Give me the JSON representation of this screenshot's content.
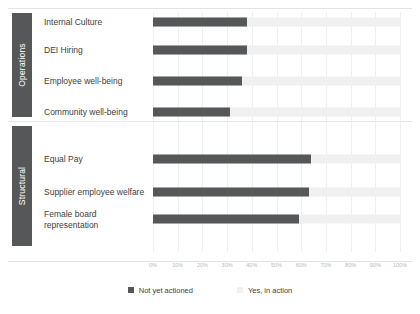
{
  "chart_data": {
    "type": "bar",
    "orientation": "horizontal",
    "stacked": true,
    "title": "",
    "xlabel": "",
    "ylabel": "",
    "xlim": [
      0,
      100
    ],
    "grid": true,
    "legend_position": "bottom",
    "axis_ticks": [
      "0%",
      "10%",
      "20%",
      "30%",
      "40%",
      "50%",
      "60%",
      "70%",
      "80%",
      "90%",
      "100%"
    ],
    "axis_tick_values": [
      0,
      10,
      20,
      30,
      40,
      50,
      60,
      70,
      80,
      90,
      100
    ],
    "legend": [
      {
        "name": "Not yet actioned",
        "color": "#555759"
      },
      {
        "name": "Yes, in action",
        "color": "#f0f0f0"
      }
    ],
    "groups": [
      {
        "name": "Operations",
        "categories": [
          {
            "label": "Internal Culture",
            "not_yet_actioned": 38,
            "yes_in_action": 62
          },
          {
            "label": "DEI Hiring",
            "not_yet_actioned": 38,
            "yes_in_action": 62
          },
          {
            "label": "Employee well-being",
            "not_yet_actioned": 36,
            "yes_in_action": 64
          },
          {
            "label": "Community well-being",
            "not_yet_actioned": 31,
            "yes_in_action": 69
          }
        ]
      },
      {
        "name": "Structural",
        "categories": [
          {
            "label": "Equal Pay",
            "not_yet_actioned": 64,
            "yes_in_action": 36
          },
          {
            "label": "Supplier employee welfare",
            "not_yet_actioned": 63,
            "yes_in_action": 37
          },
          {
            "label": "Female board representation",
            "not_yet_actioned": 59,
            "yes_in_action": 41
          }
        ]
      }
    ],
    "categories": [
      "Internal Culture",
      "DEI Hiring",
      "Employee well-being",
      "Community well-being",
      "Equal Pay",
      "Supplier employee welfare",
      "Female board representation"
    ],
    "series": [
      {
        "name": "Not yet actioned",
        "values": [
          38,
          38,
          36,
          31,
          64,
          63,
          59
        ]
      },
      {
        "name": "Yes, in action",
        "values": [
          62,
          62,
          64,
          69,
          36,
          37,
          41
        ]
      }
    ]
  },
  "colors": {
    "bar_dark": "#555759",
    "bar_light": "#f0f0f0",
    "gridline": "#efefef",
    "text": "#3d3d3d",
    "tick_text": "#b9b9b9"
  }
}
